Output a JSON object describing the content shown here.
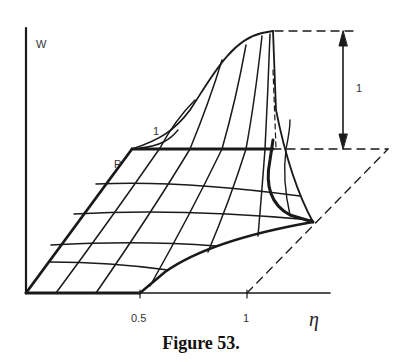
{
  "figure": {
    "caption": "Figure 53.",
    "axes": {
      "vertical_label": "W",
      "horizontal_label": "η",
      "x_ticks": [
        "0.5",
        "1"
      ]
    },
    "annotations": {
      "height_marker": "1",
      "corner_label_one": "1",
      "corner_label_p": "P"
    },
    "colors": {
      "ink": "#1a1a1a",
      "background": "#ffffff"
    }
  }
}
